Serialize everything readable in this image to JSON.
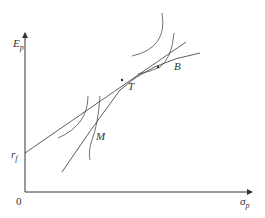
{
  "diagram": {
    "y_axis_label": "E",
    "y_axis_sub": "p",
    "x_axis_label": "σ",
    "x_axis_sub": "p",
    "origin_label": "0",
    "intercept_label": "r",
    "intercept_sub": "f",
    "points": {
      "M": "M",
      "T": "T",
      "B": "B"
    },
    "colors": {
      "line": "#333333",
      "background": "#ffffff"
    }
  }
}
